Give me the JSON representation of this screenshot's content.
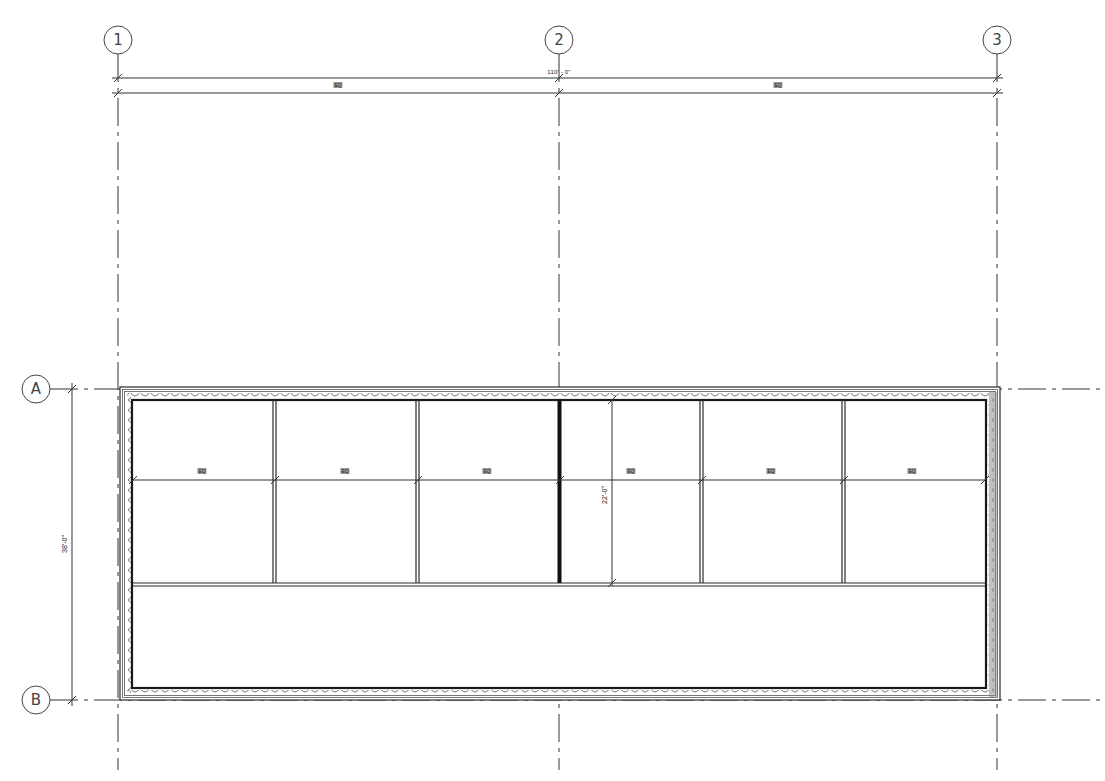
{
  "drawing": {
    "type": "floor-plan",
    "colors": {
      "line": "#2a2a2a",
      "grid": "#333333",
      "wall_fill": "#8c8c8c",
      "background": "#ffffff"
    }
  },
  "grids": {
    "vertical": [
      {
        "label": "1",
        "x": 118
      },
      {
        "label": "2",
        "x": 559
      },
      {
        "label": "3",
        "x": 997
      }
    ],
    "horizontal": [
      {
        "label": "A",
        "y": 389
      },
      {
        "label": "B",
        "y": 700
      }
    ]
  },
  "dimensions": {
    "overall_width": {
      "text": "110' - 0\"",
      "y": 78
    },
    "half_widths": [
      {
        "text": "EQ",
        "x": 338
      },
      {
        "text": "EQ",
        "x": 778
      }
    ],
    "overall_depth": {
      "text": "38'-0\"",
      "x": 72
    },
    "bay_depth": {
      "text": "22'-0\"",
      "x": 612
    },
    "bay_widths": [
      {
        "text": "EQ",
        "x": 202
      },
      {
        "text": "EQ",
        "x": 345
      },
      {
        "text": "EQ",
        "x": 487
      },
      {
        "text": "EQ",
        "x": 631
      },
      {
        "text": "EQ",
        "x": 771
      },
      {
        "text": "EQ",
        "x": 912
      }
    ]
  },
  "building": {
    "outer": {
      "x1": 120,
      "y1": 387,
      "x2": 1000,
      "y2": 700
    },
    "inner": {
      "x1": 132,
      "y1": 400,
      "x2": 986,
      "y2": 688
    },
    "partitions_x": [
      274,
      417,
      559,
      701,
      843
    ],
    "bay_bottom_y": 583,
    "eq_dim_y": 480
  }
}
